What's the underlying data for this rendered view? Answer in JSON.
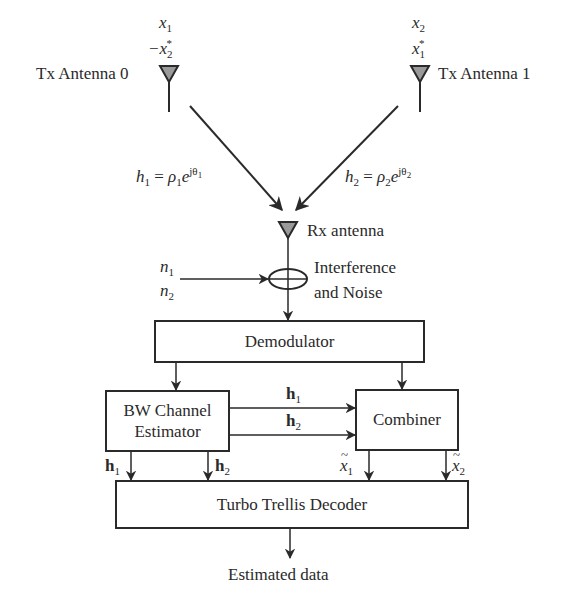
{
  "diagram": {
    "type": "block-diagram"
  },
  "tx_antenna_0": {
    "label": "Tx Antenna 0",
    "symbol_t1": "x",
    "symbol_t1_sub": "1",
    "symbol_t2_prefix": "−x",
    "symbol_t2_sub": "2",
    "symbol_t2_sup": "*"
  },
  "tx_antenna_1": {
    "label": "Tx Antenna 1",
    "symbol_t1": "x",
    "symbol_t1_sub": "2",
    "symbol_t2_prefix": "x",
    "symbol_t2_sub": "1",
    "symbol_t2_sup": "*"
  },
  "channels": {
    "h1": {
      "lhs": "h",
      "lhs_sub": "1",
      "eq": " = ",
      "rho": "ρ",
      "rho_sub": "1",
      "e": "e",
      "exp": "jθ",
      "exp_sub": "1"
    },
    "h2": {
      "lhs": "h",
      "lhs_sub": "2",
      "eq": " = ",
      "rho": "ρ",
      "rho_sub": "2",
      "e": "e",
      "exp": "jθ",
      "exp_sub": "2"
    }
  },
  "rx_antenna": {
    "label": "Rx antenna"
  },
  "noise": {
    "n1": "n",
    "n1_sub": "1",
    "n2": "n",
    "n2_sub": "2",
    "label_line1": "Interference",
    "label_line2": "and Noise"
  },
  "blocks": {
    "demodulator": "Demodulator",
    "channel_estimator_line1": "BW Channel",
    "channel_estimator_line2": "Estimator",
    "combiner": "Combiner",
    "decoder": "Turbo Trellis Decoder"
  },
  "signals": {
    "h_bold": "h",
    "h1_sub": "1",
    "h2_sub": "2",
    "xt": "x",
    "xt1_sub": "1",
    "xt2_sub": "2"
  },
  "output": {
    "label": "Estimated data"
  },
  "colors": {
    "stroke": "#2a2a2a",
    "antenna_fill": "#9a9a9a",
    "background": "#ffffff"
  }
}
